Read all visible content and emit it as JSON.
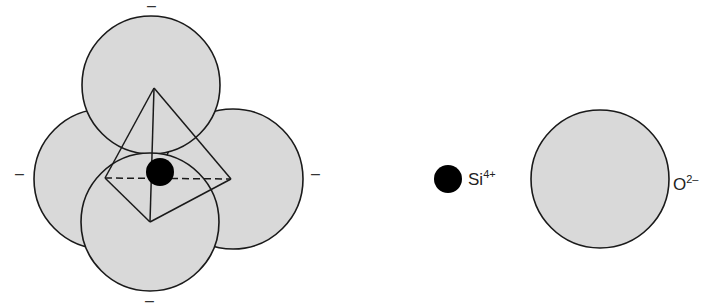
{
  "diagram": {
    "type": "silicon-oxygen tetrahedron",
    "colors": {
      "oxygen_fill": "#d9d9d9",
      "outline": "#1a1a1a",
      "silicon_fill": "#000000",
      "background": "#ffffff"
    },
    "charges": {
      "top": "–",
      "left": "–",
      "right": "–",
      "bottom": "–"
    },
    "legend": {
      "silicon": {
        "symbol": "Si",
        "charge": "4+"
      },
      "oxygen": {
        "symbol": "O",
        "charge": "2–"
      }
    }
  }
}
